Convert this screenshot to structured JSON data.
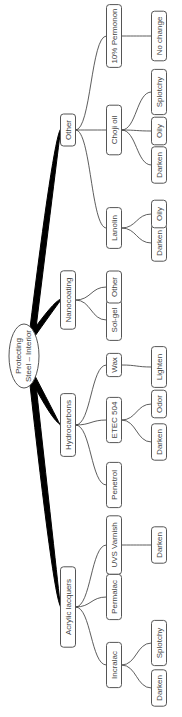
{
  "diagram": {
    "type": "mind-map",
    "orientation": "rotated-90-ccw",
    "root": {
      "label_line1": "Protecting",
      "label_line2": "Steel – Interior"
    },
    "branches": [
      {
        "label": "Acrylic lacquers",
        "children": [
          {
            "label": "Incralac",
            "children": [
              {
                "label": "Darken"
              },
              {
                "label": "Splotchy"
              }
            ]
          },
          {
            "label": "Permalac",
            "children": []
          },
          {
            "label": "UVS Varnish",
            "children": [
              {
                "label": "Darken"
              }
            ]
          }
        ]
      },
      {
        "label": "Hydrocarbons",
        "children": [
          {
            "label": "Penetrol",
            "children": []
          },
          {
            "label": "ETEC 504",
            "children": [
              {
                "label": "Darken"
              },
              {
                "label": "Odor"
              }
            ]
          },
          {
            "label": "Wax",
            "children": [
              {
                "label": "Lighten"
              }
            ]
          }
        ]
      },
      {
        "label": "Nanocoating",
        "children": [
          {
            "label": "Sol-gel",
            "children": []
          },
          {
            "label": "Other",
            "children": []
          }
        ]
      },
      {
        "label": "Other",
        "children": [
          {
            "label": "Lanolin",
            "children": [
              {
                "label": "Darken"
              },
              {
                "label": "Oily"
              }
            ]
          },
          {
            "label": "Choji oil",
            "children": [
              {
                "label": "Darken"
              },
              {
                "label": "Oily"
              },
              {
                "label": "Splotchy"
              }
            ]
          },
          {
            "label": "10% Permonon",
            "children": [
              {
                "label": "No change"
              }
            ]
          }
        ]
      }
    ]
  }
}
